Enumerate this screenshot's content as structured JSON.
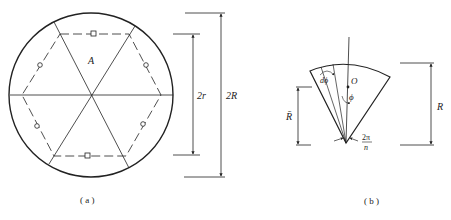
{
  "figure_a": {
    "caption": "( a )",
    "region_label": "A",
    "dim_inner_label": "2r",
    "dim_outer_label": "2R"
  },
  "figure_b": {
    "caption": "( b )",
    "center_label": "O",
    "angle_label": "ϕ",
    "dphi_label": "dϕ",
    "sector_angle_num": "2π",
    "sector_angle_den": "n",
    "mean_radius_label": "R̄",
    "radius_label": "R"
  },
  "colors": {
    "stroke": "#222222",
    "background": "#ffffff"
  }
}
